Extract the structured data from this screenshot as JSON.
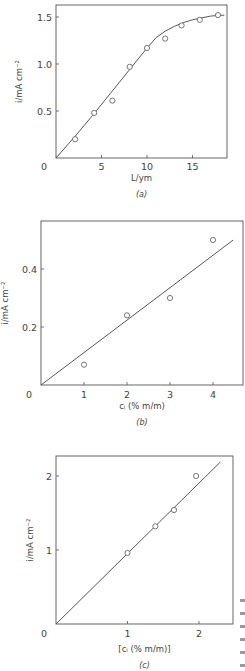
{
  "chart_data": [
    {
      "type": "scatter",
      "panel": "(a)",
      "caption": "(a)",
      "xlabel": "L/ym",
      "ylabel": "i/mA cm⁻²",
      "x_ticks": [
        "0",
        "5",
        "10",
        "15"
      ],
      "y_ticks": [
        "0.5",
        "1.0",
        "1.5"
      ],
      "xlim": [
        0,
        18.8
      ],
      "ylim": [
        0,
        1.62
      ],
      "grid": false,
      "legend": "none",
      "series": [
        {
          "name": "measured",
          "style": "open-circle",
          "x": [
            2.1,
            4.2,
            6.2,
            8.1,
            10.0,
            12.0,
            13.8,
            15.8,
            17.8
          ],
          "y": [
            0.2,
            0.48,
            0.61,
            0.97,
            1.17,
            1.27,
            1.41,
            1.47,
            1.52
          ]
        },
        {
          "name": "fit curve",
          "style": "line",
          "x": [
            0,
            2,
            4,
            6,
            8,
            10,
            11,
            12,
            13,
            14,
            15,
            16,
            17,
            18.5
          ],
          "y": [
            0,
            0.22,
            0.45,
            0.69,
            0.93,
            1.17,
            1.28,
            1.35,
            1.4,
            1.44,
            1.47,
            1.49,
            1.51,
            1.52
          ]
        }
      ]
    },
    {
      "type": "scatter",
      "panel": "(b)",
      "caption": "(b)",
      "xlabel": "cᵢ (% m/m)",
      "ylabel": "i/mA cm⁻²",
      "x_ticks": [
        "0",
        "1",
        "2",
        "3",
        "4"
      ],
      "y_ticks": [
        "0.2",
        "0.4"
      ],
      "xlim": [
        0,
        4.7
      ],
      "ylim": [
        0,
        0.56
      ],
      "grid": false,
      "legend": "none",
      "series": [
        {
          "name": "measured",
          "style": "open-circle",
          "x": [
            1.0,
            2.0,
            3.0,
            4.0
          ],
          "y": [
            0.07,
            0.24,
            0.3,
            0.5
          ]
        },
        {
          "name": "linear fit",
          "style": "line",
          "x": [
            0,
            4.47
          ],
          "y": [
            0,
            0.5
          ]
        }
      ]
    },
    {
      "type": "scatter",
      "panel": "(c)",
      "caption": "(c)",
      "xlabel": "[cᵢ (% m/m)]",
      "ylabel": "i/mA cm⁻²",
      "x_ticks": [
        "0",
        "1",
        "2"
      ],
      "y_ticks": [
        "1",
        "2"
      ],
      "xlim": [
        0,
        2.48
      ],
      "ylim": [
        0,
        2.28
      ],
      "grid": false,
      "legend": "none",
      "series": [
        {
          "name": "measured",
          "style": "open-circle",
          "x": [
            1.0,
            1.39,
            1.65,
            1.96
          ],
          "y": [
            0.96,
            1.32,
            1.54,
            2.0
          ]
        },
        {
          "name": "linear fit",
          "style": "line",
          "x": [
            0,
            2.3
          ],
          "y": [
            0,
            2.19
          ]
        }
      ]
    }
  ],
  "layout": {
    "panels": [
      {
        "left": 56,
        "top": 5,
        "right": 227,
        "bottom": 158,
        "x_unit_px": 9.1,
        "y_unit_px": 94,
        "x_tick_values": [
          0,
          5,
          10,
          15
        ],
        "y_tick_values": [
          0.5,
          1.0,
          1.5
        ],
        "ylabel_x": 22,
        "xlabel_y": 181,
        "caption_y": 197,
        "tick_label_y": 170
      },
      {
        "left": 41,
        "top": 221,
        "right": 243,
        "bottom": 385,
        "x_unit_px": 43,
        "y_unit_px": 290,
        "x_tick_values": [
          0,
          1,
          2,
          3,
          4
        ],
        "y_tick_values": [
          0.2,
          0.4
        ],
        "ylabel_x": 8,
        "xlabel_y": 409,
        "caption_y": 425,
        "tick_label_y": 398
      },
      {
        "left": 56,
        "top": 456,
        "right": 233,
        "bottom": 624,
        "x_unit_px": 71.5,
        "y_unit_px": 74,
        "x_tick_values": [
          0,
          1,
          2
        ],
        "y_tick_values": [
          1,
          2
        ],
        "ylabel_x": 33,
        "xlabel_y": 652,
        "caption_y": 668,
        "tick_label_y": 637
      }
    ]
  }
}
